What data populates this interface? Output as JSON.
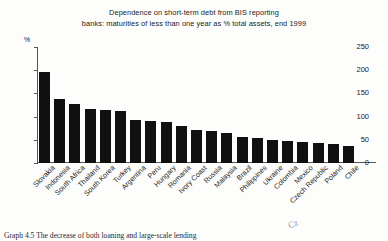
{
  "chart_data": {
    "type": "bar",
    "title": "Dependence on short-term debt from BIS reporting banks: maturities of less than one year as % total assets, end 1999",
    "title_lines": [
      "Dependence on short-term debt from BIS reporting",
      "banks: maturities of less than one year as % total assets, end 1999"
    ],
    "xlabel": "",
    "ylabel": "%",
    "ylim": [
      0,
      250
    ],
    "yticks": [
      0,
      50,
      100,
      150,
      200,
      250
    ],
    "ytick_labels": [
      "0",
      "50",
      "100",
      "150",
      "200",
      "250"
    ],
    "grid": false,
    "legend": false,
    "bar_color": "#101010",
    "categories": [
      "Slovakia",
      "Indonesia",
      "South Africa",
      "Thailand",
      "South Korea",
      "Turkey",
      "Argentina",
      "Peru",
      "Hungary",
      "Romania",
      "Ivory Coast",
      "Russia",
      "Malaysia",
      "Brazil",
      "Philippines",
      "Ukraine",
      "Colombia",
      "Mexico",
      "Czech Republic",
      "Poland",
      "Chile"
    ],
    "values": [
      196,
      137,
      127,
      116,
      114,
      113,
      93,
      90,
      89,
      79,
      72,
      68,
      65,
      55,
      53,
      50,
      47,
      45,
      43,
      41,
      37
    ]
  },
  "footer": {
    "caption": "Graph 4.5   The decrease of both loaning and large-scale lending",
    "margin_mark": "Cz"
  }
}
